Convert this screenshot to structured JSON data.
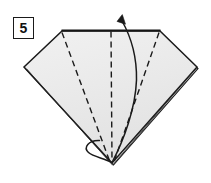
{
  "figure": {
    "step_badge": {
      "label": "5",
      "name": "step-number-badge"
    },
    "paper": {
      "fill_color": "#e9e9e9",
      "fill_color_light": "#f2f2f2",
      "outline_color": "#1a1a1a",
      "background_color": "#ffffff"
    },
    "shape": {
      "description": "Kite / diamond shaped folded paper with flat horizontal top edge and sharp bottom point",
      "vertices": {
        "top_left": [
          62,
          31
        ],
        "top_right": [
          160,
          31
        ],
        "left": [
          24,
          67
        ],
        "right": [
          197,
          67
        ],
        "bottom_point": [
          112,
          163
        ]
      }
    },
    "crease_lines": {
      "style": "dashed",
      "color": "#1a1a1a",
      "count": 3,
      "lines": [
        {
          "name": "left-valley-fold",
          "from": [
            62,
            32
          ],
          "to": [
            110,
            162
          ]
        },
        {
          "name": "center-valley-fold",
          "from": [
            111,
            31
          ],
          "to": [
            112,
            162
          ]
        },
        {
          "name": "right-valley-fold",
          "from": [
            159,
            32
          ],
          "to": [
            114,
            162
          ]
        }
      ]
    },
    "arrow": {
      "name": "fold-up-arrow",
      "type": "curved-arrow-with-loop",
      "color": "#1a1a1a",
      "direction": "upward",
      "tip": [
        122,
        16
      ],
      "tail": [
        112,
        163
      ],
      "loop_center": [
        95,
        146
      ],
      "label": ""
    },
    "layer_edges": {
      "name": "paper-layer-edges",
      "description": "Double lines along lower-left and lower-right edges indicating stacked paper layers"
    }
  }
}
